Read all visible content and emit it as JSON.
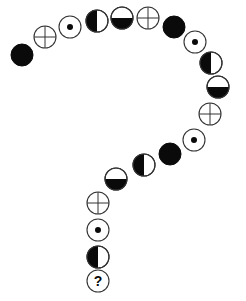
{
  "colors": {
    "stroke": "#333333",
    "fill": "#0a0a0a",
    "background": "#ffffff"
  },
  "radius": 11,
  "question_label": "?",
  "symbols": [
    {
      "type": "solid",
      "x": 22,
      "y": 55
    },
    {
      "type": "crosshair",
      "x": 45,
      "y": 37
    },
    {
      "type": "dot",
      "x": 70,
      "y": 27
    },
    {
      "type": "half-left",
      "x": 97,
      "y": 21
    },
    {
      "type": "half-bottom",
      "x": 122,
      "y": 18
    },
    {
      "type": "crosshair",
      "x": 148,
      "y": 18
    },
    {
      "type": "solid",
      "x": 174,
      "y": 27
    },
    {
      "type": "dot",
      "x": 195,
      "y": 42
    },
    {
      "type": "half-left",
      "x": 211,
      "y": 63
    },
    {
      "type": "half-bottom",
      "x": 218,
      "y": 87
    },
    {
      "type": "crosshair",
      "x": 210,
      "y": 114
    },
    {
      "type": "dot",
      "x": 194,
      "y": 140
    },
    {
      "type": "solid",
      "x": 170,
      "y": 154
    },
    {
      "type": "half-left",
      "x": 144,
      "y": 165
    },
    {
      "type": "half-bottom",
      "x": 116,
      "y": 179
    },
    {
      "type": "crosshair",
      "x": 98,
      "y": 203
    },
    {
      "type": "dot",
      "x": 98,
      "y": 230
    },
    {
      "type": "half-left",
      "x": 98,
      "y": 257
    },
    {
      "type": "question",
      "x": 98,
      "y": 281
    }
  ]
}
